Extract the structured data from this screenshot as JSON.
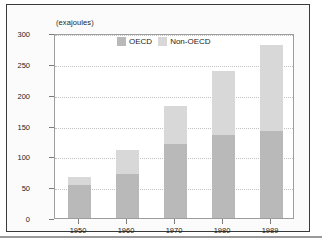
{
  "chart_data": {
    "type": "bar",
    "stacked": true,
    "title": "",
    "subtitle": "",
    "xlabel": "",
    "ylabel": "(exajoules)",
    "unit_caption": "(exajoules)",
    "categories": [
      "1950",
      "1960",
      "1970",
      "1980",
      "1989"
    ],
    "series": [
      {
        "name": "OECD",
        "color": "#b9b9b9",
        "values": [
          53,
          72,
          120,
          134,
          141
        ]
      },
      {
        "name": "Non-OECD",
        "color": "#d8d8d8",
        "values": [
          14,
          38,
          62,
          104,
          139
        ]
      }
    ],
    "totals": [
      67,
      110,
      182,
      238,
      280
    ],
    "ylim": [
      0,
      300
    ],
    "yticks": [
      0,
      50,
      100,
      150,
      200,
      250,
      300
    ],
    "ytick_labels": [
      "0",
      "50",
      "100",
      "150",
      "200",
      "250",
      "300"
    ],
    "grid": true,
    "grid_axis": "y",
    "legend_position": "top-center",
    "legend": [
      "OECD",
      "Non-OECD"
    ]
  },
  "legend": {
    "items": [
      {
        "label": "OECD",
        "color": "#b9b9b9"
      },
      {
        "label": "Non-OECD",
        "color": "#d8d8d8"
      }
    ]
  }
}
